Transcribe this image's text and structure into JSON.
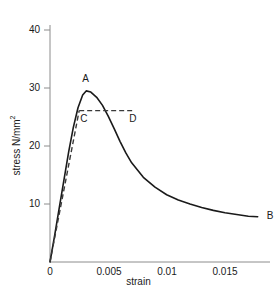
{
  "chart_data": {
    "type": "line",
    "title": "",
    "xlabel": "strain",
    "ylabel": "stress N/mm",
    "ylabel_exponent": "2",
    "xlim": [
      0,
      0.019
    ],
    "ylim": [
      0,
      44
    ],
    "xticks": [
      "0",
      "0.005",
      "0.01",
      "0.015"
    ],
    "xtick_values": [
      0,
      0.005,
      0.01,
      0.015
    ],
    "yticks": [
      "10",
      "20",
      "30",
      "40"
    ],
    "ytick_values": [
      10,
      20,
      30,
      40
    ],
    "grid": false,
    "legend": "none",
    "series": [
      {
        "name": "stress-strain-curve",
        "style": "solid",
        "x": [
          0,
          0.0004,
          0.0008,
          0.0012,
          0.0016,
          0.002,
          0.0024,
          0.0028,
          0.0031,
          0.0035,
          0.004,
          0.0045,
          0.005,
          0.0055,
          0.006,
          0.0065,
          0.007,
          0.008,
          0.009,
          0.01,
          0.011,
          0.012,
          0.013,
          0.014,
          0.015,
          0.016,
          0.017,
          0.0178
        ],
        "y": [
          0,
          4.6,
          9.4,
          14.2,
          19.0,
          23.2,
          26.6,
          28.8,
          29.5,
          29.3,
          28.4,
          27.0,
          25.1,
          23.0,
          20.8,
          18.8,
          17.1,
          14.6,
          12.9,
          11.6,
          10.7,
          10.0,
          9.4,
          8.9,
          8.5,
          8.2,
          7.9,
          7.8
        ]
      },
      {
        "name": "elastic-construction-line",
        "style": "dashed",
        "x": [
          0,
          0.0025
        ],
        "y": [
          0,
          26.1
        ]
      },
      {
        "name": "proof-stress-plateau",
        "style": "dashed",
        "x": [
          0.0025,
          0.0073
        ],
        "y": [
          26.1,
          26.1
        ]
      }
    ],
    "annotations": [
      {
        "label": "A",
        "x": 0.0031,
        "y": 29.5,
        "note": "peak stress"
      },
      {
        "label": "B",
        "x": 0.0178,
        "y": 7.8,
        "note": "curve end"
      },
      {
        "label": "C",
        "x": 0.0025,
        "y": 26.1,
        "note": "plateau left"
      },
      {
        "label": "D",
        "x": 0.0073,
        "y": 26.1,
        "note": "plateau right"
      }
    ]
  },
  "axes": {
    "line_color": "#808080",
    "curve_color": "#1a1a1a"
  }
}
